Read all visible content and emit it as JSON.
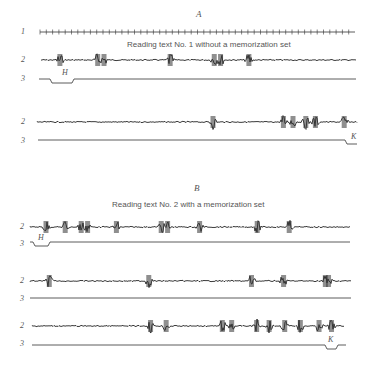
{
  "panels": [
    {
      "letter": "A",
      "caption": "Reading text No. 1 without a memorization set",
      "timer_label": "1",
      "rows": [
        {
          "signal_label": "2",
          "event_label": "3",
          "event_marker": "H",
          "bursts": [
            0.06,
            0.18,
            0.2,
            0.41,
            0.55,
            0.57,
            0.66
          ]
        },
        {
          "signal_label": "2",
          "event_label": "3",
          "event_marker": "K",
          "bursts": [
            0.55,
            0.77,
            0.8,
            0.84,
            0.87,
            0.96
          ]
        }
      ]
    },
    {
      "letter": "B",
      "caption": "Reading text No. 2 with a memorization set",
      "rows": [
        {
          "signal_label": "2",
          "event_label": "3",
          "event_marker": "H",
          "bursts": [
            0.05,
            0.11,
            0.16,
            0.18,
            0.27,
            0.41,
            0.43,
            0.53,
            0.71,
            0.81
          ]
        },
        {
          "signal_label": "2",
          "event_label": "3",
          "event_marker": "",
          "bursts": [
            0.06,
            0.37,
            0.69,
            0.79,
            0.92,
            0.93
          ]
        },
        {
          "signal_label": "2",
          "event_label": "3",
          "event_marker": "K",
          "bursts": [
            0.38,
            0.43,
            0.61,
            0.64,
            0.72,
            0.76,
            0.81,
            0.86,
            0.92,
            0.96
          ]
        }
      ]
    }
  ]
}
